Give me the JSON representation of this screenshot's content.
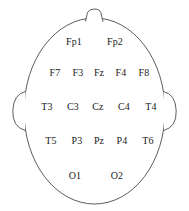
{
  "figure": {
    "background_color": "#ffffff",
    "outline_color": "#4a4a4a",
    "label_color": "#1a1a1a",
    "width": 189,
    "height": 211
  },
  "anatomy": {
    "head_label": "head-outline",
    "nose_label": "nose-marker",
    "left_ear_label": "left-ear",
    "right_ear_label": "right-ear"
  },
  "electrodes": {
    "rows": [
      {
        "name": "prefrontal",
        "y": 42,
        "labels": [
          {
            "text": "Fp1",
            "x": 74
          },
          {
            "text": "Fp2",
            "x": 115
          }
        ]
      },
      {
        "name": "frontal",
        "y": 73,
        "labels": [
          {
            "text": "F7",
            "x": 55
          },
          {
            "text": "F3",
            "x": 78
          },
          {
            "text": "Fz",
            "x": 99
          },
          {
            "text": "F4",
            "x": 121
          },
          {
            "text": "F8",
            "x": 144
          }
        ]
      },
      {
        "name": "central",
        "y": 107,
        "labels": [
          {
            "text": "T3",
            "x": 47
          },
          {
            "text": "C3",
            "x": 73
          },
          {
            "text": "Cz",
            "x": 98
          },
          {
            "text": "C4",
            "x": 124
          },
          {
            "text": "T4",
            "x": 151
          }
        ]
      },
      {
        "name": "parietal",
        "y": 141,
        "labels": [
          {
            "text": "T5",
            "x": 51
          },
          {
            "text": "P3",
            "x": 77
          },
          {
            "text": "Pz",
            "x": 99
          },
          {
            "text": "P4",
            "x": 122
          },
          {
            "text": "T6",
            "x": 148
          }
        ]
      },
      {
        "name": "occipital",
        "y": 176,
        "labels": [
          {
            "text": "O1",
            "x": 75
          },
          {
            "text": "O2",
            "x": 117
          }
        ]
      }
    ]
  }
}
